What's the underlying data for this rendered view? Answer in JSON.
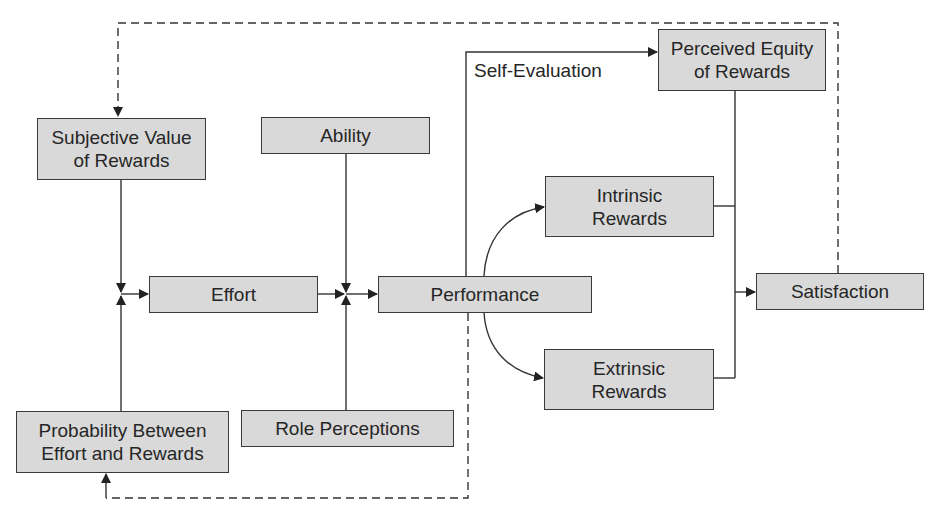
{
  "diagram": {
    "type": "flowchart",
    "nodes": {
      "subjective_value": "Subjective Value\nof Rewards",
      "ability": "Ability",
      "perceived_equity": "Perceived Equity\nof Rewards",
      "intrinsic_rewards": "Intrinsic\nRewards",
      "effort": "Effort",
      "performance": "Performance",
      "satisfaction": "Satisfaction",
      "extrinsic_rewards": "Extrinsic\nRewards",
      "probability": "Probability Between\nEffort and Rewards",
      "role_perceptions": "Role Perceptions"
    },
    "edge_labels": {
      "self_evaluation": "Self-Evaluation"
    },
    "edges": [
      {
        "from": "Subjective Value of Rewards",
        "to": "Effort",
        "style": "solid"
      },
      {
        "from": "Probability Between Effort and Rewards",
        "to": "Effort",
        "style": "solid"
      },
      {
        "from": "Effort",
        "to": "Performance",
        "style": "solid"
      },
      {
        "from": "Ability",
        "to": "Performance",
        "style": "solid"
      },
      {
        "from": "Role Perceptions",
        "to": "Performance",
        "style": "solid"
      },
      {
        "from": "Performance",
        "to": "Perceived Equity of Rewards",
        "style": "solid",
        "label": "Self-Evaluation"
      },
      {
        "from": "Performance",
        "to": "Intrinsic Rewards",
        "style": "solid"
      },
      {
        "from": "Performance",
        "to": "Extrinsic Rewards",
        "style": "solid"
      },
      {
        "from": "Perceived Equity of Rewards",
        "to": "Satisfaction",
        "style": "solid"
      },
      {
        "from": "Intrinsic Rewards",
        "to": "Satisfaction",
        "style": "solid"
      },
      {
        "from": "Extrinsic Rewards",
        "to": "Satisfaction",
        "style": "solid"
      },
      {
        "from": "Satisfaction",
        "to": "Subjective Value of Rewards",
        "style": "dashed"
      },
      {
        "from": "Performance",
        "to": "Probability Between Effort and Rewards",
        "style": "dashed"
      }
    ],
    "colors": {
      "box_fill": "#d9d9d9",
      "box_border": "#3a3a3a",
      "line": "#333333"
    }
  }
}
